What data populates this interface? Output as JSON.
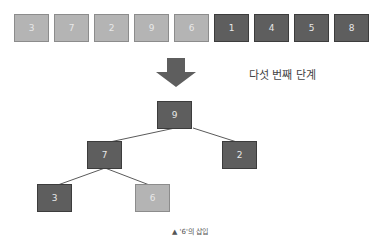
{
  "array": [
    {
      "value": "3",
      "state": "light"
    },
    {
      "value": "7",
      "state": "light"
    },
    {
      "value": "2",
      "state": "light"
    },
    {
      "value": "9",
      "state": "light"
    },
    {
      "value": "6",
      "state": "light"
    },
    {
      "value": "1",
      "state": "dark"
    },
    {
      "value": "4",
      "state": "dark"
    },
    {
      "value": "5",
      "state": "dark"
    },
    {
      "value": "8",
      "state": "dark"
    }
  ],
  "step_label": "다섯 번째 단계",
  "tree": {
    "root": {
      "value": "9",
      "state": "dark"
    },
    "left": {
      "value": "7",
      "state": "dark"
    },
    "right": {
      "value": "2",
      "state": "dark"
    },
    "left_left": {
      "value": "3",
      "state": "dark"
    },
    "left_right": {
      "value": "6",
      "state": "light"
    }
  },
  "caption": "▲ '6'의 삽입",
  "colors": {
    "light": "#b4b4b4",
    "dark": "#5e5e5e",
    "arrow": "#5e5e5e",
    "edge": "#5a5a5a"
  }
}
